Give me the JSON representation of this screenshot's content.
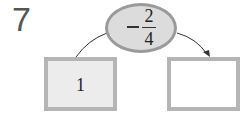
{
  "problem_number": "7",
  "operator": {
    "sign": "−",
    "numerator": "2",
    "denominator": "4",
    "label": "−2/4"
  },
  "input_box": {
    "value": "1"
  },
  "output_box": {
    "value": ""
  },
  "colors": {
    "ellipse_fill": "#dcdcdc",
    "ellipse_border": "#9a9a9a",
    "box_border": "#b5b5b5",
    "input_fill": "#ececec",
    "output_fill": "#ffffff"
  }
}
